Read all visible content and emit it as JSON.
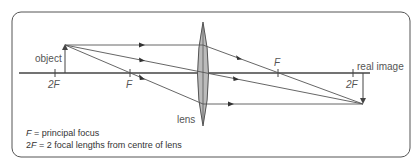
{
  "diagram": {
    "type": "ray-diagram",
    "colors": {
      "frame": "#555555",
      "line": "#555555",
      "lens_fill": "#bbbbbb",
      "lens_stroke": "#555555",
      "text": "#555555",
      "legend_text": "#333333"
    },
    "labels": {
      "object": "object",
      "lens": "lens",
      "real_image": "real image",
      "focus_left": "F",
      "focus_right": "F",
      "two_f_left": "2F",
      "two_f_right": "2F"
    },
    "legend": {
      "line1_symbol": "F",
      "line1_text": " = principal focus",
      "line2_symbol_num": "2",
      "line2_symbol": "F",
      "line2_text": " = 2 focal lengths from centre of lens"
    },
    "geometry": {
      "axis_y": 73,
      "object_x": 65,
      "object_tip_y": 45,
      "lens_x": 203,
      "lens_top_y": 22,
      "lens_bottom_y": 126,
      "f_left_x": 130,
      "two_f_left_x": 55,
      "f_right_x": 278,
      "two_f_right_x": 353,
      "image_x": 363,
      "image_tip_y": 104
    },
    "rays": [
      {
        "name": "parallel-ray",
        "path": "parallel to axis, refracts through far focus"
      },
      {
        "name": "central-ray",
        "path": "passes undeviated through centre of lens"
      },
      {
        "name": "focal-ray",
        "path": "passes through near focus, emerges parallel to axis"
      }
    ]
  }
}
